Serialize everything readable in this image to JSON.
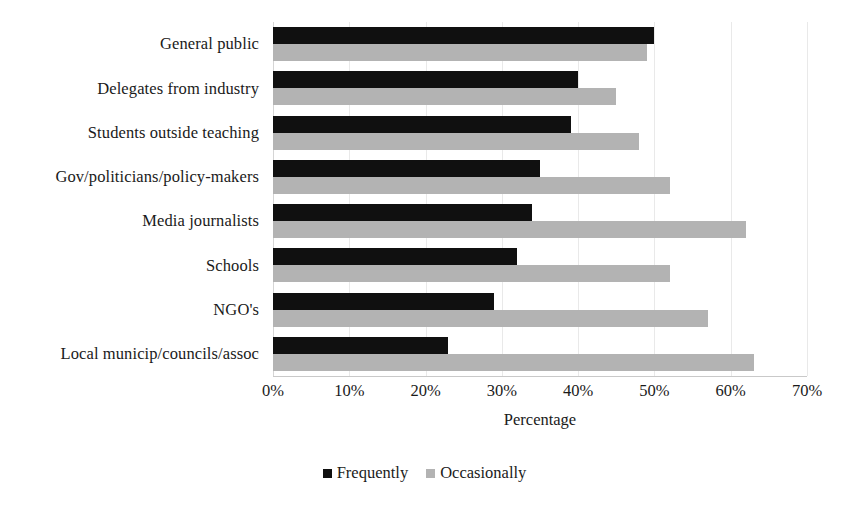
{
  "chart_data": {
    "type": "bar",
    "orientation": "horizontal",
    "title": "",
    "xlabel": "Percentage",
    "ylabel": "",
    "xlim": [
      0,
      70
    ],
    "xtick_labels": [
      "0%",
      "10%",
      "20%",
      "30%",
      "40%",
      "50%",
      "60%",
      "70%"
    ],
    "xtick_values": [
      0,
      10,
      20,
      30,
      40,
      50,
      60,
      70
    ],
    "grid": true,
    "legend_position": "bottom",
    "categories": [
      "General public",
      "Delegates from industry",
      "Students outside teaching",
      "Gov/politicians/policy-makers",
      "Media journalists",
      "Schools",
      "NGO's",
      "Local municip/councils/assoc"
    ],
    "series": [
      {
        "name": "Frequently",
        "color": "#101010",
        "values": [
          50,
          40,
          39,
          35,
          34,
          32,
          29,
          23
        ]
      },
      {
        "name": "Occasionally",
        "color": "#b3b3b3",
        "values": [
          49,
          45,
          48,
          52,
          62,
          52,
          57,
          63
        ]
      }
    ]
  }
}
